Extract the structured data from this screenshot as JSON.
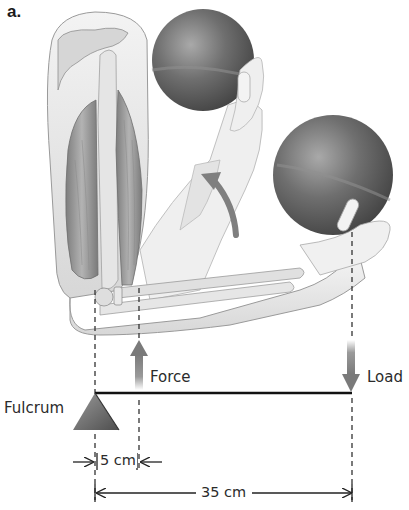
{
  "figure": {
    "panel_label": "a.",
    "labels": {
      "force": "Force",
      "load": "Load",
      "fulcrum": "Fulcrum"
    },
    "measurements": {
      "fulcrum_to_force": "5 cm",
      "fulcrum_to_load": "35 cm"
    },
    "icons": {
      "force_arrow": "arrow-up",
      "load_arrow": "arrow-down",
      "fulcrum": "triangle",
      "rotation_arrow": "curved-arrow-up"
    },
    "colors": {
      "arrow": "#7a7a7a",
      "lever": "#111111",
      "fulcrum": "#6e6e6e",
      "ball": "#5a5a5a",
      "skin": "#eeeeee",
      "muscle": "#9a9a9a",
      "bone": "#dcdcdc"
    }
  }
}
